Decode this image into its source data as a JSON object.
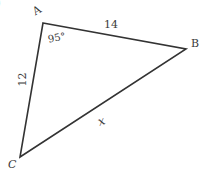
{
  "diagram": {
    "type": "triangle",
    "stroke_color": "#333333",
    "vertices": {
      "A": {
        "label": "A",
        "x": 43,
        "y": 23
      },
      "B": {
        "label": "B",
        "x": 186,
        "y": 49
      },
      "C": {
        "label": "C",
        "x": 20,
        "y": 157
      }
    },
    "sides": {
      "AB": {
        "label": "14"
      },
      "AC": {
        "label": "12"
      },
      "BC": {
        "label": "x"
      }
    },
    "angles": {
      "A": {
        "label": "95°"
      }
    },
    "fragment": {
      "text": ")"
    }
  }
}
